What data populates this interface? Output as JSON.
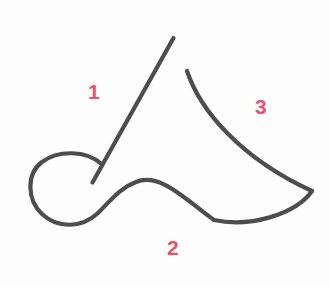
{
  "canvas": {
    "width": 330,
    "height": 287,
    "background_color": "#fefefe"
  },
  "drawing": {
    "title": "Stroke order diagram",
    "stroke_color": "#4d4d4d",
    "stroke_width": 4.2,
    "label_color": "#e8536a",
    "strokes": [
      {
        "number": "1",
        "name": "diagonal-descender",
        "description": "Straight diagonal line descending from upper right to lower left",
        "path": "M 173.5 38 L 92.5 182.5",
        "label": {
          "text": "1",
          "x": 88,
          "y": 81
        }
      },
      {
        "number": "2",
        "name": "loop-and-sweep",
        "description": "Loop at lower left crossing stroke 1, then long sweeping curve to the right cusp",
        "path": "M 101.5 164 C 86 150 58 150 42 162 C 26 174 27 200 42 214 C 58 229 82 228 98 213 C 112 199 120 188 136 182 C 160 172 186 200 214 220 C 250 228 296 214 312 191",
        "label": {
          "text": "2",
          "x": 167,
          "y": 237
        }
      },
      {
        "number": "3",
        "name": "upper-right-arc",
        "description": "Concave arc from upper middle sweeping down and right to meet the cusp",
        "path": "M 187 71 C 200 110 240 158 312 191",
        "label": {
          "text": "3",
          "x": 255,
          "y": 96
        }
      }
    ]
  }
}
